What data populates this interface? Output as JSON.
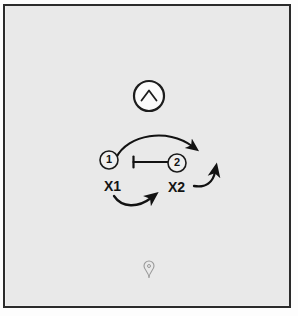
{
  "diagram": {
    "background_color": "#e9e9e9",
    "frame_color": "#2b2b2b",
    "ink_color": "#141414",
    "top_icon": {
      "name": "chevron-up-in-circle",
      "glyph": "^",
      "cx": 149,
      "cy": 96,
      "r": 15
    },
    "bottom_icon": {
      "name": "location-pin",
      "cx": 149,
      "cy": 270
    },
    "players": [
      {
        "id": "player-1",
        "label": "1",
        "cx": 109,
        "cy": 160,
        "r": 9
      },
      {
        "id": "player-2",
        "label": "2",
        "cx": 177,
        "cy": 163,
        "r": 9
      }
    ],
    "defenders": [
      {
        "id": "defender-x1",
        "label": "X1",
        "x": 104,
        "y": 178
      },
      {
        "id": "defender-x2",
        "label": "X2",
        "x": 168,
        "y": 179
      }
    ],
    "screen": {
      "name": "screen-bar",
      "x1": 133,
      "x2": 170,
      "y": 162,
      "tick_height": 11
    },
    "arrows": [
      {
        "id": "arrow-cut-over-top",
        "from": "player-1",
        "to": "right-wing",
        "style": "curved"
      },
      {
        "id": "arrow-x1-chase",
        "from": "defender-x1",
        "to": "right",
        "style": "curved"
      },
      {
        "id": "arrow-x2-recover",
        "from": "defender-x2",
        "to": "upper-right",
        "style": "curved"
      }
    ]
  }
}
